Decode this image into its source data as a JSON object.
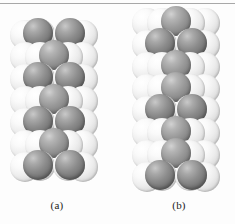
{
  "figure": {
    "background_color": "#fdfdfd",
    "rule_color": "#a8a8a8",
    "colors": {
      "foreground_sphere": "#757575",
      "background_sphere": "#ededed",
      "outline": "#a9a9a9",
      "caption_text": "#1c1c1c"
    }
  },
  "panels": [
    {
      "id": "a",
      "caption": "(a)",
      "description": "close-packed sphere stacking model, left column",
      "rows": 7,
      "row_pattern": [
        "pair",
        "single",
        "pair",
        "single",
        "pair",
        "single",
        "pair"
      ]
    },
    {
      "id": "b",
      "caption": "(b)",
      "description": "close-packed sphere stacking model, right column",
      "rows": 8,
      "row_pattern": [
        "single",
        "pair",
        "single",
        "single",
        "pair",
        "single",
        "single",
        "pair"
      ]
    }
  ]
}
